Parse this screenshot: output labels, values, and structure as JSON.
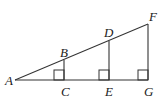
{
  "diagram": {
    "type": "geometry",
    "points": {
      "A": {
        "label": "A",
        "x": 15,
        "y": 80
      },
      "B": {
        "label": "B",
        "x": 64,
        "y": 60
      },
      "C": {
        "label": "C",
        "x": 64,
        "y": 80
      },
      "D": {
        "label": "D",
        "x": 109,
        "y": 41
      },
      "E": {
        "label": "E",
        "x": 109,
        "y": 80
      },
      "F": {
        "label": "F",
        "x": 148,
        "y": 24
      },
      "G": {
        "label": "G",
        "x": 148,
        "y": 80
      }
    },
    "segments": [
      [
        "A",
        "F"
      ],
      [
        "A",
        "G"
      ],
      [
        "B",
        "C"
      ],
      [
        "D",
        "E"
      ],
      [
        "F",
        "G"
      ]
    ],
    "right_angles": [
      "C",
      "E",
      "G"
    ],
    "colors": {
      "line": "#333333",
      "background": "#ffffff"
    }
  }
}
